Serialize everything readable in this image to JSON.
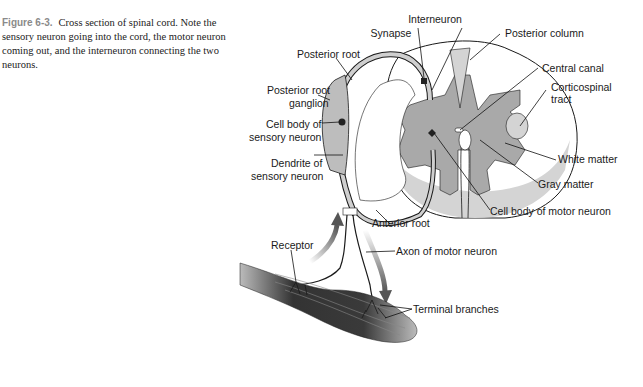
{
  "caption": {
    "figure_label": "Figure 6-3.",
    "text": "Cross section of spinal cord. Note the sensory neuron going into the cord, the motor neuron coming out, and the interneuron connecting the two neurons."
  },
  "labels": {
    "interneuron": "Interneuron",
    "synapse": "Synapse",
    "posterior_column": "Posterior column",
    "posterior_root": "Posterior root",
    "central_canal": "Central canal",
    "posterior_root_ganglion_1": "Posterior root",
    "posterior_root_ganglion_2": "ganglion",
    "corticospinal_1": "Corticospinal",
    "corticospinal_2": "tract",
    "cell_body_sensory_1": "Cell body of",
    "cell_body_sensory_2": "sensory neuron",
    "white_matter": "White matter",
    "dendrite_1": "Dendrite of",
    "dendrite_2": "sensory neuron",
    "gray_matter": "Gray matter",
    "anterior_root": "Anterior root",
    "cell_body_motor": "Cell body of motor neuron",
    "receptor": "Receptor",
    "axon_motor": "Axon of motor neuron",
    "terminal_branches": "Terminal branches"
  },
  "colors": {
    "gray_matter": "#a9a9a9",
    "white_matter_light": "#d4d4d4",
    "outline": "#1a1a1a",
    "muscle": "#4a4a4a"
  }
}
